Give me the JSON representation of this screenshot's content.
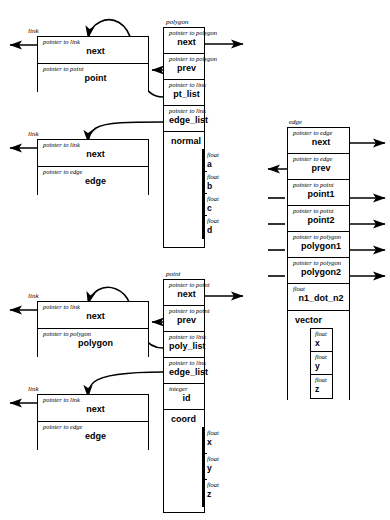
{
  "diagram": {
    "ink": "#000000",
    "paper": "#ffffff"
  },
  "structs": {
    "link_point": {
      "label": "link",
      "fields": [
        {
          "type": "pointer to link",
          "name": "next"
        },
        {
          "type": "pointer to point",
          "name": "point"
        }
      ]
    },
    "link_edge_top": {
      "label": "link",
      "fields": [
        {
          "type": "pointer to link",
          "name": "next"
        },
        {
          "type": "pointer to edge",
          "name": "edge"
        }
      ]
    },
    "link_polygon": {
      "label": "link",
      "fields": [
        {
          "type": "pointer to link",
          "name": "next"
        },
        {
          "type": "pointer to polygon",
          "name": "polygon"
        }
      ]
    },
    "link_edge_bottom": {
      "label": "link",
      "fields": [
        {
          "type": "pointer to link",
          "name": "next"
        },
        {
          "type": "pointer to edge",
          "name": "edge"
        }
      ]
    },
    "polygon": {
      "label": "polygon",
      "fields": [
        {
          "type": "pointer to polygon",
          "name": "next"
        },
        {
          "type": "pointer to polygon",
          "name": "prev"
        },
        {
          "type": "pointer to link",
          "name": "pt_list"
        },
        {
          "type": "pointer to link",
          "name": "edge_list"
        }
      ],
      "group": {
        "name": "normal",
        "members": [
          {
            "type": "float",
            "name": "a"
          },
          {
            "type": "float",
            "name": "b"
          },
          {
            "type": "float",
            "name": "c"
          },
          {
            "type": "float",
            "name": "d"
          }
        ]
      }
    },
    "point": {
      "label": "point",
      "fields": [
        {
          "type": "pointer to point",
          "name": "next"
        },
        {
          "type": "pointer to point",
          "name": "prev"
        },
        {
          "type": "pointer to link",
          "name": "poly_list"
        },
        {
          "type": "pointer to link",
          "name": "edge_list"
        },
        {
          "type": "integer",
          "name": "id"
        }
      ],
      "group": {
        "name": "coord",
        "members": [
          {
            "type": "float",
            "name": "x"
          },
          {
            "type": "float",
            "name": "y"
          },
          {
            "type": "float",
            "name": "z"
          }
        ]
      }
    },
    "edge": {
      "label": "edge",
      "fields": [
        {
          "type": "pointer to edge",
          "name": "next"
        },
        {
          "type": "pointer to edge",
          "name": "prev"
        },
        {
          "type": "pointer to point",
          "name": "point1"
        },
        {
          "type": "pointer to point",
          "name": "point2"
        },
        {
          "type": "pointer to polygon",
          "name": "polygon1"
        },
        {
          "type": "pointer to polygon",
          "name": "polygon2"
        },
        {
          "type": "float",
          "name": "n1_dot_n2"
        }
      ],
      "group": {
        "name": "vector",
        "members": [
          {
            "type": "float",
            "name": "x"
          },
          {
            "type": "float",
            "name": "y"
          },
          {
            "type": "float",
            "name": "z"
          }
        ]
      }
    }
  }
}
